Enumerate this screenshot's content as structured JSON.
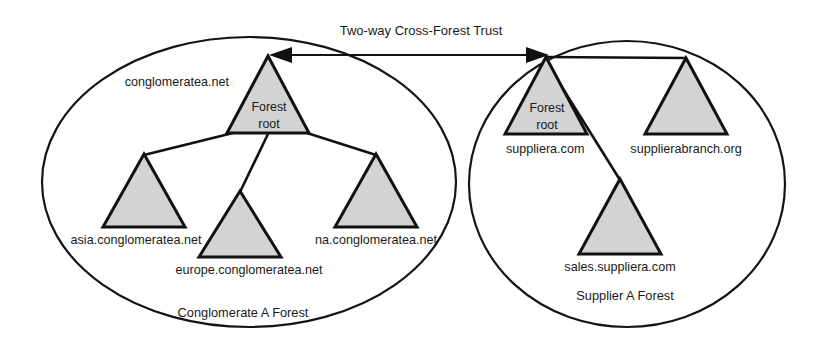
{
  "diagram": {
    "title_text": "Two-way Cross-Forest Trust",
    "trust_arrow": {
      "label": "Two-way Cross-Forest Trust",
      "direction": "bidirectional"
    },
    "colors": {
      "triangle_fill": "#d3d3d3",
      "stroke": "#111111",
      "background": "#ffffff",
      "text": "#1a1a1a"
    },
    "forests": [
      {
        "id": "conglomerate-a",
        "caption": "Conglomerate A Forest",
        "root": {
          "label": "conglomeratea.net",
          "inner_line_1": "Forest",
          "inner_line_2": "root"
        },
        "children": [
          {
            "label": "asia.conglomeratea.net"
          },
          {
            "label": "europe.conglomeratea.net"
          },
          {
            "label": "na.conglomeratea.net"
          }
        ]
      },
      {
        "id": "supplier-a",
        "caption": "Supplier A Forest",
        "root": {
          "label": "suppliera.com",
          "inner_line_1": "Forest",
          "inner_line_2": "root"
        },
        "children": [
          {
            "label": "supplierabranch.org"
          },
          {
            "label": "sales.suppliera.com"
          }
        ]
      }
    ]
  }
}
